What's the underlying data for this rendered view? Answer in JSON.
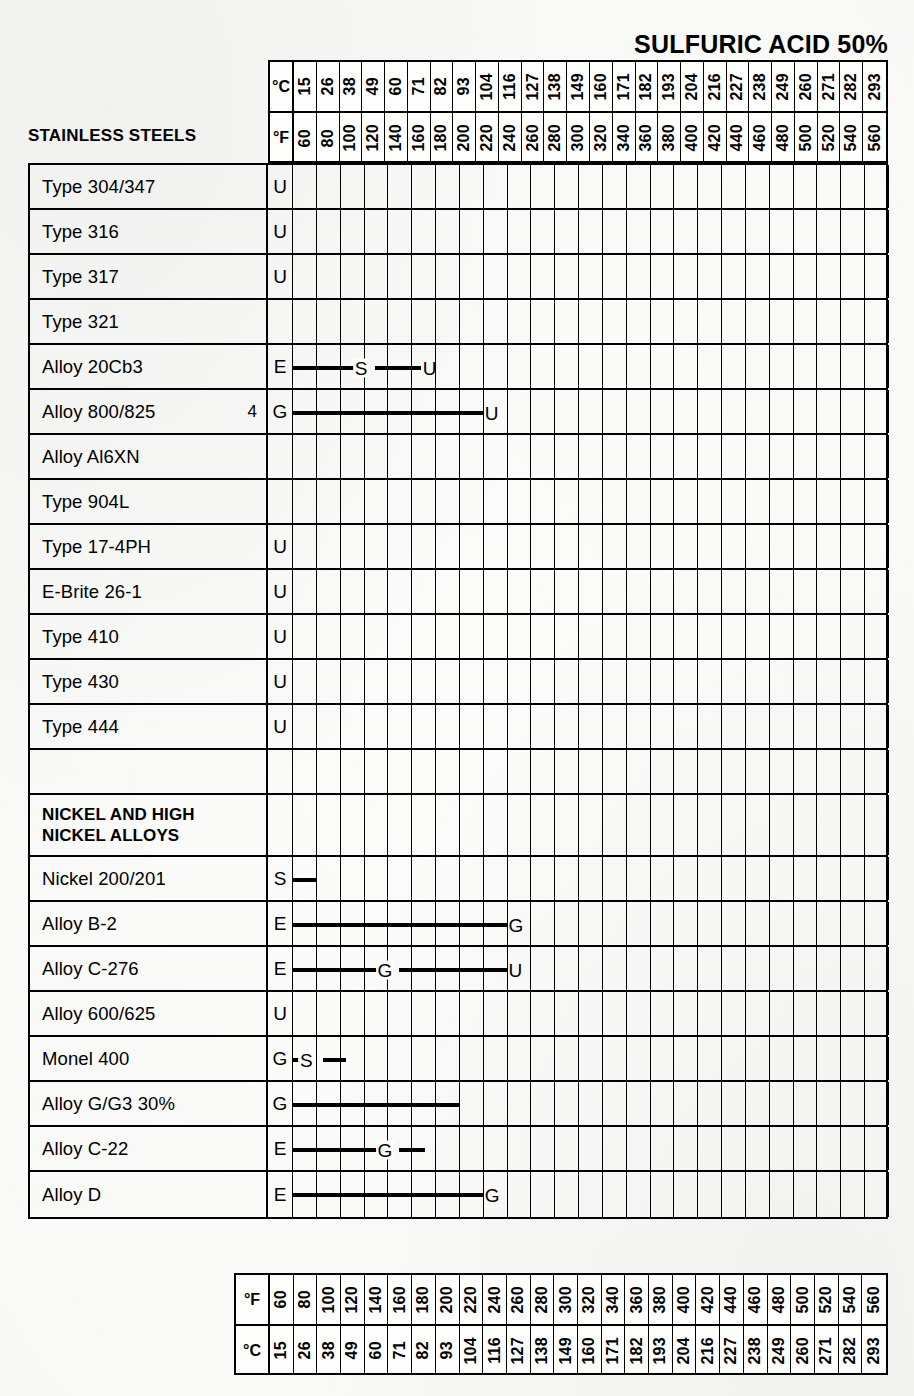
{
  "title": "SULFURIC ACID 50%",
  "axis": {
    "unit_c_label": "°C",
    "unit_f_label": "°F",
    "fahrenheit": [
      60,
      80,
      100,
      120,
      140,
      160,
      180,
      200,
      220,
      240,
      260,
      280,
      300,
      320,
      340,
      360,
      380,
      400,
      420,
      440,
      460,
      480,
      500,
      520,
      540,
      560
    ],
    "celsius": [
      15,
      26,
      38,
      49,
      60,
      71,
      82,
      93,
      104,
      116,
      127,
      138,
      149,
      160,
      171,
      182,
      193,
      204,
      216,
      227,
      238,
      249,
      260,
      271,
      282,
      293
    ]
  },
  "groups": {
    "stainless_caption": "STAINLESS STEELS",
    "nickel_caption_line1": "NICKEL AND HIGH",
    "nickel_caption_line2": "NICKEL ALLOYS"
  },
  "legend_codes": {
    "E": "Excellent",
    "G": "Good",
    "S": "Satisfactory",
    "U": "Unsatisfactory"
  },
  "chart_data": {
    "type": "table",
    "title": "SULFURIC ACID 50%",
    "xlabel": "Temperature",
    "ylabel": "Alloy",
    "x_units": [
      "°F",
      "°C"
    ],
    "xlim_f": [
      60,
      560
    ],
    "xlim_c": [
      15,
      293
    ],
    "x_ticks_f": [
      60,
      80,
      100,
      120,
      140,
      160,
      180,
      200,
      220,
      240,
      260,
      280,
      300,
      320,
      340,
      360,
      380,
      400,
      420,
      440,
      460,
      480,
      500,
      520,
      540,
      560
    ],
    "x_ticks_c": [
      15,
      26,
      38,
      49,
      60,
      71,
      82,
      93,
      104,
      116,
      127,
      138,
      149,
      160,
      171,
      182,
      193,
      204,
      216,
      227,
      238,
      249,
      260,
      271,
      282,
      293
    ],
    "grid": true,
    "legend_position": "none",
    "codes": [
      "E",
      "G",
      "S",
      "U"
    ],
    "rows": [
      {
        "label": "Type 304/347",
        "kind": "data",
        "note": "",
        "start_code": "U",
        "segments": []
      },
      {
        "label": "Type 316",
        "kind": "data",
        "note": "",
        "start_code": "U",
        "segments": []
      },
      {
        "label": "Type 317",
        "kind": "data",
        "note": "",
        "start_code": "U",
        "segments": []
      },
      {
        "label": "Type 321",
        "kind": "data",
        "note": "",
        "start_code": "",
        "segments": []
      },
      {
        "label": "Alloy 20Cb3",
        "kind": "data",
        "note": "",
        "start_code": "E",
        "segments": [
          {
            "from_f": 60,
            "to_f": 118,
            "end_code": "S",
            "end_type": "mid"
          },
          {
            "from_f": 130,
            "to_f": 168,
            "end_code": "U",
            "end_type": "end"
          }
        ]
      },
      {
        "label": "Alloy 800/825",
        "kind": "data",
        "note": "4",
        "start_code": "G",
        "segments": [
          {
            "from_f": 60,
            "to_f": 220,
            "end_code": "U",
            "end_type": "end"
          }
        ]
      },
      {
        "label": "Alloy Al6XN",
        "kind": "data",
        "note": "",
        "start_code": "",
        "segments": []
      },
      {
        "label": "Type 904L",
        "kind": "data",
        "note": "",
        "start_code": "",
        "segments": []
      },
      {
        "label": "Type 17-4PH",
        "kind": "data",
        "note": "",
        "start_code": "U",
        "segments": []
      },
      {
        "label": "E-Brite 26-1",
        "kind": "data",
        "note": "",
        "start_code": "U",
        "segments": []
      },
      {
        "label": "Type 410",
        "kind": "data",
        "note": "",
        "start_code": "U",
        "segments": []
      },
      {
        "label": "Type 430",
        "kind": "data",
        "note": "",
        "start_code": "U",
        "segments": []
      },
      {
        "label": "Type 444",
        "kind": "data",
        "note": "",
        "start_code": "U",
        "segments": []
      },
      {
        "label": "",
        "kind": "spacer",
        "note": "",
        "start_code": "",
        "segments": []
      },
      {
        "label": "NICKEL AND HIGH NICKEL ALLOYS",
        "kind": "group",
        "note": "",
        "start_code": "",
        "segments": []
      },
      {
        "label": "Nickel 200/201",
        "kind": "data",
        "note": "",
        "start_code": "S",
        "segments": [
          {
            "from_f": 60,
            "to_f": 80,
            "end_code": "",
            "end_type": "none"
          }
        ]
      },
      {
        "label": "Alloy B-2",
        "kind": "data",
        "note": "",
        "start_code": "E",
        "segments": [
          {
            "from_f": 60,
            "to_f": 240,
            "end_code": "G",
            "end_type": "end"
          }
        ]
      },
      {
        "label": "Alloy C-276",
        "kind": "data",
        "note": "",
        "start_code": "E",
        "segments": [
          {
            "from_f": 60,
            "to_f": 138,
            "end_code": "G",
            "end_type": "mid"
          },
          {
            "from_f": 150,
            "to_f": 240,
            "end_code": "U",
            "end_type": "end"
          }
        ]
      },
      {
        "label": "Alloy 600/625",
        "kind": "data",
        "note": "",
        "start_code": "U",
        "segments": []
      },
      {
        "label": "Monel 400",
        "kind": "data",
        "note": "",
        "start_code": "G",
        "segments": [
          {
            "from_f": 60,
            "to_f": 72,
            "end_code": "S",
            "end_type": "mid"
          },
          {
            "from_f": 86,
            "to_f": 105,
            "end_code": "",
            "end_type": "none"
          }
        ]
      },
      {
        "label": "Alloy G/G3 30%",
        "kind": "data",
        "note": "",
        "start_code": "G",
        "segments": [
          {
            "from_f": 60,
            "to_f": 200,
            "end_code": "",
            "end_type": "none"
          }
        ]
      },
      {
        "label": "Alloy C-22",
        "kind": "data",
        "note": "",
        "start_code": "E",
        "segments": [
          {
            "from_f": 60,
            "to_f": 138,
            "end_code": "G",
            "end_type": "mid"
          },
          {
            "from_f": 150,
            "to_f": 172,
            "end_code": "",
            "end_type": "none"
          }
        ]
      },
      {
        "label": "Alloy D",
        "kind": "data",
        "note": "",
        "start_code": "E",
        "segments": [
          {
            "from_f": 60,
            "to_f": 220,
            "end_code": "G",
            "end_type": "end"
          }
        ]
      }
    ]
  }
}
